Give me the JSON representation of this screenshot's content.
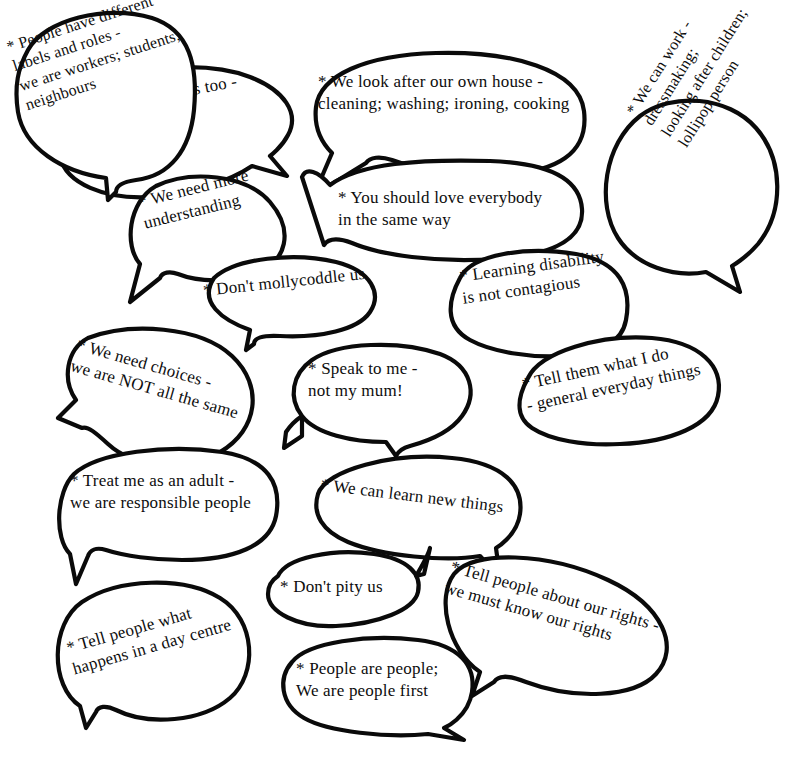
{
  "diagram": {
    "background_color": "#ffffff",
    "line_color": "#0a0a0a",
    "text_color": "#0d0d0d",
    "bubble_count": 17,
    "bubbles": [
      {
        "id": "we-have-feelings",
        "text": "* We have feelings too -\nwe can be hurt",
        "rotation": -11,
        "font_size": 17
      },
      {
        "id": "we-look-after-our-own-house",
        "text": "* We look after our own house -\ncleaning; washing; ironing, cooking",
        "rotation": 0,
        "font_size": 17
      },
      {
        "id": "we-can-work",
        "text": "* We can work -\ndressmaking;\nlooking after children;\nlollipop person",
        "rotation": -58,
        "font_size": 16
      },
      {
        "id": "we-need-more-understanding",
        "text": "* We need more\nunderstanding",
        "rotation": -14,
        "font_size": 17
      },
      {
        "id": "you-should-love-everybody",
        "text": "* You should love everybody\nin the same way",
        "rotation": 0,
        "font_size": 17
      },
      {
        "id": "dont-mollycoddle-us",
        "text": "* Don't mollycoddle us",
        "rotation": -6,
        "font_size": 17
      },
      {
        "id": "learning-disability-not-contagious",
        "text": "* Learning disability\nis not contagious",
        "rotation": -8,
        "font_size": 17
      },
      {
        "id": "we-need-choices",
        "text": "* We need choices -\nwe are NOT all the same",
        "rotation": 16,
        "font_size": 17
      },
      {
        "id": "speak-to-me",
        "text": "* Speak to me -\nnot my mum!",
        "rotation": 0,
        "font_size": 17
      },
      {
        "id": "tell-them-what-i-do",
        "text": "* Tell them what I do\n- general everyday things",
        "rotation": -12,
        "font_size": 17
      },
      {
        "id": "treat-me-as-an-adult",
        "text": "* Treat me as an adult -\nwe are responsible people",
        "rotation": 0,
        "font_size": 17
      },
      {
        "id": "we-can-learn-new-things",
        "text": "* We can learn new things",
        "rotation": 7,
        "font_size": 17
      },
      {
        "id": "people-have-different-labels",
        "text": "* People have different\nlabels and roles -\nwe are workers; students;\nneighbours",
        "rotation": -18,
        "font_size": 16
      },
      {
        "id": "dont-pity-us",
        "text": "* Don't pity us",
        "rotation": 0,
        "font_size": 17
      },
      {
        "id": "tell-people-about-our-rights",
        "text": "* Tell people about our rights -\nwe must know our rights",
        "rotation": 16,
        "font_size": 17
      },
      {
        "id": "tell-people-what-happens",
        "text": "* Tell people what\nhappens in a day centre",
        "rotation": -16,
        "font_size": 17
      },
      {
        "id": "people-are-people",
        "text": "* People are people;\nWe are people first",
        "rotation": 0,
        "font_size": 17
      }
    ]
  }
}
